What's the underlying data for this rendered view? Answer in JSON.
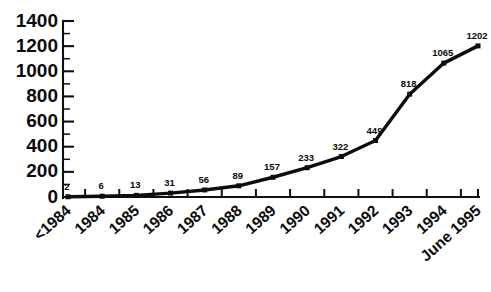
{
  "chart_data": {
    "type": "line",
    "title": "",
    "subtitle": "",
    "xlabel": "",
    "ylabel": "",
    "categories": [
      "<1984",
      "1984",
      "1985",
      "1986",
      "1987",
      "1988",
      "1989",
      "1990",
      "1991",
      "1992",
      "1993",
      "1994",
      "June 1995"
    ],
    "values": [
      2,
      6,
      13,
      31,
      56,
      89,
      157,
      233,
      322,
      449,
      818,
      1065,
      1202
    ],
    "point_labels": [
      "2",
      "6",
      "13",
      "31",
      "56",
      "89",
      "157",
      "233",
      "322",
      "449",
      "818",
      "1065",
      "1202"
    ],
    "ylim": [
      0,
      1400
    ],
    "ytick_labels": [
      "0",
      "200",
      "400",
      "600",
      "800",
      "1000",
      "1200",
      "1400"
    ],
    "ytick_values": [
      0,
      200,
      400,
      600,
      800,
      1000,
      1200,
      1400
    ],
    "yminor_step": 100,
    "grid": false,
    "legend": false,
    "legend_position": "none",
    "series": [
      {
        "name": "",
        "values": [
          2,
          6,
          13,
          31,
          56,
          89,
          157,
          233,
          322,
          449,
          818,
          1065,
          1202
        ],
        "color": "#0d0d0d",
        "marker": "square"
      }
    ],
    "colors": {
      "line": "#0d0d0d",
      "marker": "#0d0d0d",
      "axis": "#101010",
      "text": "#0b0b0b",
      "background": "#ffffff"
    }
  }
}
